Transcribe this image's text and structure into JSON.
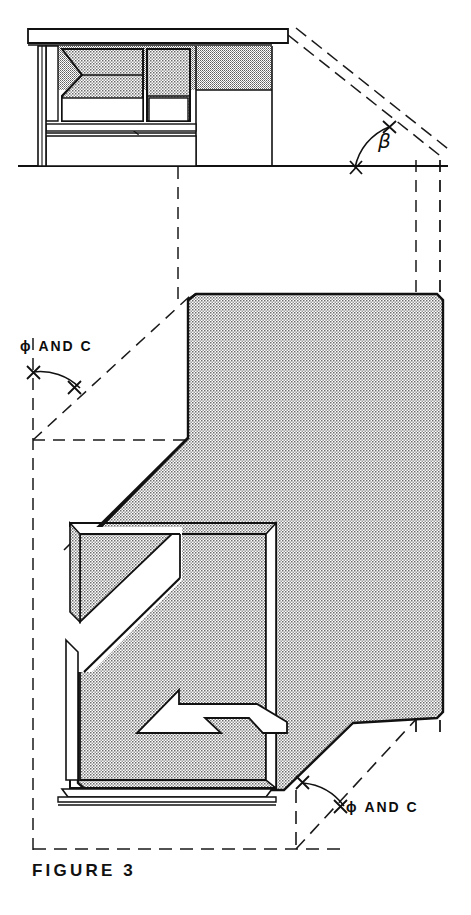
{
  "figure": {
    "caption": "FIGURE 3",
    "domain": "architectural-section-drawing",
    "background_color": "#ffffff",
    "line_color": "#111111",
    "stipple_fill_color": "#c9c9c9"
  },
  "annotations": {
    "beta": {
      "symbol": "β",
      "name": "beta-angle-label"
    },
    "phi_and_c_upper": {
      "text": "ϕ  AND  C",
      "name": "phi-and-c-upper-label"
    },
    "phi_and_c_lower": {
      "text": "ϕ  AND  C",
      "name": "phi-and-c-lower-label"
    }
  },
  "elements": {
    "upper_building": "building-elevation-upper",
    "ground_line": "ground-line",
    "main_mass": "main-shaded-mass",
    "interior_void": "interior-void",
    "arrow_detail": "arrow-step-detail",
    "base_plinth": "base-plinth",
    "projection_lines": "dashed-projection-lines"
  }
}
